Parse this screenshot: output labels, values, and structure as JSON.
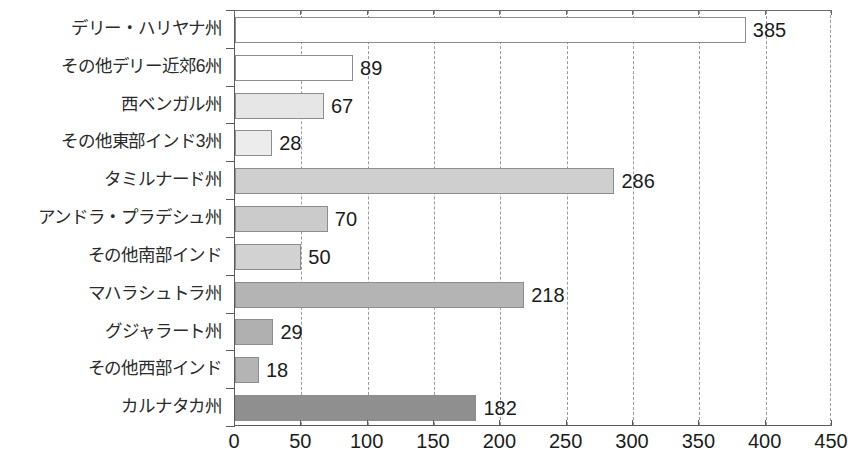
{
  "chart_data": {
    "type": "bar",
    "orientation": "horizontal",
    "title": "",
    "subtitle": "",
    "xlabel": "",
    "ylabel": "",
    "xlim": [
      0,
      450
    ],
    "xticks": [
      0,
      50,
      100,
      150,
      200,
      250,
      300,
      350,
      400,
      450
    ],
    "grid": "vertical-dashed",
    "legend": "none",
    "categories": [
      "デリー・ハリヤナ州",
      "その他デリー近郊6州",
      "西ベンガル州",
      "その他東部インド3州",
      "タミルナード州",
      "アンドラ・プラデシュ州",
      "その他南部インド",
      "マハラシュトラ州",
      "グジャラート州",
      "その他西部インド",
      "カルナタカ州"
    ],
    "values": [
      385,
      89,
      67,
      28,
      286,
      70,
      50,
      218,
      29,
      18,
      182
    ],
    "value_labels": [
      "385",
      "89",
      "67",
      "28",
      "286",
      "70",
      "50",
      "218",
      "29",
      "18",
      "182"
    ],
    "bar_colors": [
      "#ffffff",
      "#ffffff",
      "#e6e6e6",
      "#ececec",
      "#cfcfcf",
      "#cbcbcb",
      "#d2d2d2",
      "#b4b4b4",
      "#b0b0b0",
      "#b4b4b4",
      "#8f8f8f"
    ],
    "bar_border_color": "#8d8d8d",
    "axis_color": "#5a5a5a",
    "grid_color": "#9a9a9a",
    "text_color": "#1c1c1c"
  }
}
